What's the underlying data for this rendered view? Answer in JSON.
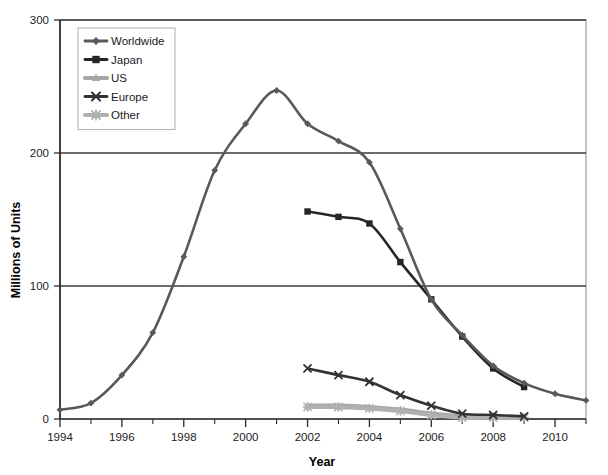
{
  "chart_data": {
    "type": "line",
    "title": "",
    "xlabel": "Year",
    "ylabel": "Millions of Units",
    "xlim": [
      1994,
      2011
    ],
    "ylim": [
      0,
      300
    ],
    "yticks": [
      0,
      100,
      200,
      300
    ],
    "xticks": [
      1994,
      1996,
      1998,
      2000,
      2002,
      2004,
      2006,
      2008,
      2010
    ],
    "xtick_labels": [
      "1994",
      "1996",
      "1998",
      "2000",
      "2002",
      "2004",
      "2006",
      "2008",
      "2010"
    ],
    "ytick_labels": [
      "0",
      "100",
      "200",
      "300"
    ],
    "grid": "horizontal",
    "legend_position": "top-left",
    "series": [
      {
        "name": "Worldwide",
        "marker": "diamond",
        "color": "#595959",
        "x": [
          1994,
          1995,
          1996,
          1997,
          1998,
          1999,
          2000,
          2001,
          2002,
          2003,
          2004,
          2005,
          2006,
          2007,
          2008,
          2009,
          2010,
          2011
        ],
        "values": [
          7,
          12,
          33,
          65,
          122,
          187,
          222,
          247,
          222,
          209,
          193,
          143,
          90,
          63,
          40,
          27,
          19,
          14
        ]
      },
      {
        "name": "Japan",
        "marker": "square",
        "color": "#262626",
        "x": [
          2002,
          2003,
          2004,
          2005,
          2006,
          2007,
          2008,
          2009
        ],
        "values": [
          156,
          152,
          147,
          118,
          90,
          62,
          38,
          24
        ]
      },
      {
        "name": "US",
        "marker": "triangle",
        "color": "#a6a6a6",
        "x": [
          2002,
          2003,
          2004,
          2005,
          2006,
          2007,
          2008,
          2009
        ],
        "values": [
          10,
          10,
          9,
          7,
          4,
          2,
          1,
          1
        ]
      },
      {
        "name": "Europe",
        "marker": "x",
        "color": "#333333",
        "x": [
          2002,
          2003,
          2004,
          2005,
          2006,
          2007,
          2008,
          2009
        ],
        "values": [
          38,
          33,
          28,
          18,
          10,
          4,
          3,
          2
        ]
      },
      {
        "name": "Other",
        "marker": "asterisk",
        "color": "#b0b0b0",
        "x": [
          2002,
          2003,
          2004,
          2005,
          2006,
          2007,
          2008,
          2009
        ],
        "values": [
          9,
          9,
          8,
          6,
          3,
          1,
          1,
          1
        ]
      }
    ]
  },
  "axes": {
    "y_title": "Millions of Units",
    "x_title": "Year"
  },
  "legend": {
    "items": [
      {
        "label": "Worldwide"
      },
      {
        "label": "Japan"
      },
      {
        "label": "US"
      },
      {
        "label": "Europe"
      },
      {
        "label": "Other"
      }
    ]
  }
}
